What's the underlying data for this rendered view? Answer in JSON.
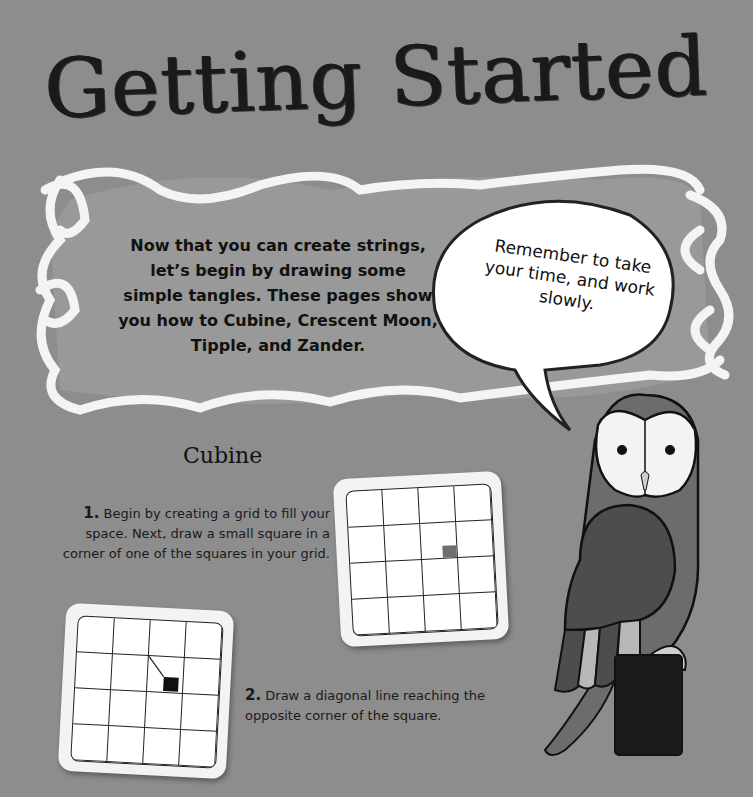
{
  "page": {
    "title": "Getting Started",
    "background_color": "#8d8d8d"
  },
  "intro": {
    "text": "Now that you can create strings, let’s begin by drawing some simple tangles. These pages show you how to Cubine, Crescent Moon, Tipple, and Zander."
  },
  "speech_bubble": {
    "text": "Remember to take your time, and work slowly."
  },
  "section": {
    "title": "Cubine",
    "steps": [
      {
        "number": "1.",
        "text": "Begin by creating a grid to fill your space. Next, draw a small square in a corner of one of the squares in your grid."
      },
      {
        "number": "2.",
        "text": "Draw a diagonal line reaching the opposite corner of the square."
      }
    ]
  },
  "illustrations": {
    "grid_card_1": {
      "rows": 4,
      "cols": 4,
      "marker": "small gray square"
    },
    "grid_card_2": {
      "rows": 4,
      "cols": 4,
      "marker": "black square with diagonal line"
    },
    "owl": "owl perched on post"
  }
}
